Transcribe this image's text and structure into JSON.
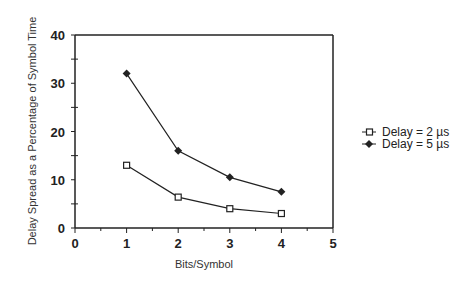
{
  "chart_data": {
    "type": "line",
    "title": "",
    "xlabel": "Bits/Symbol",
    "ylabel": "Delay Spread as a Percentage of Symbol Time",
    "x": [
      1,
      2,
      3,
      4
    ],
    "series": [
      {
        "name": "Delay = 2 µs",
        "marker": "square-open",
        "values": [
          13,
          6.4,
          4,
          3
        ]
      },
      {
        "name": "Delay = 5 µs",
        "marker": "diamond-filled",
        "values": [
          32,
          16,
          10.5,
          7.5
        ]
      }
    ],
    "xlim": [
      0,
      5
    ],
    "ylim": [
      0,
      40
    ],
    "xticks": [
      "0",
      "1",
      "2",
      "3",
      "4",
      "5"
    ],
    "yticks": [
      "0",
      "10",
      "20",
      "30",
      "40"
    ],
    "grid": false,
    "legend_position": "right"
  }
}
